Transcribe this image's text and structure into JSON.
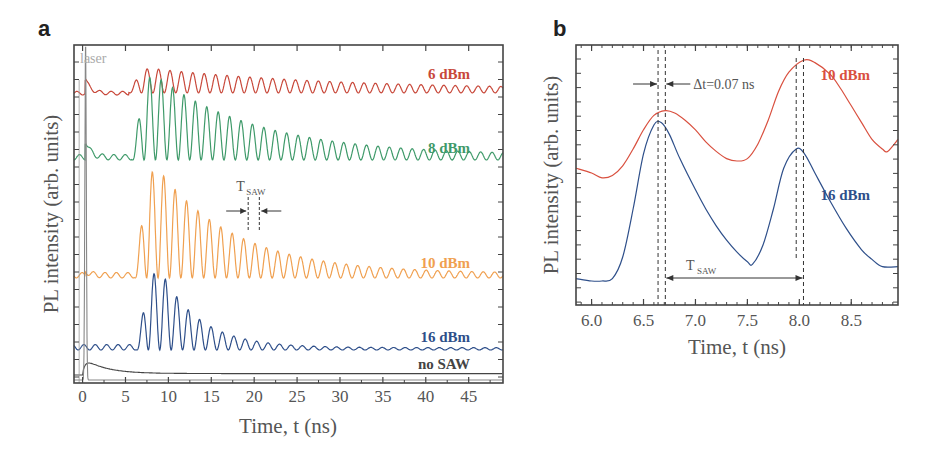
{
  "chart_data": [
    {
      "panel": "a",
      "type": "line",
      "title": "",
      "xlabel": "Time, t (ns)",
      "ylabel": "PL intensity (arb. units)",
      "xlim": [
        -1,
        49
      ],
      "xticks": [
        0,
        5,
        10,
        15,
        20,
        25,
        30,
        35,
        40,
        45
      ],
      "grid": false,
      "annotations": {
        "laser": "laser",
        "tsaw_main": "T",
        "tsaw_sub": "SAW",
        "tsaw_markers_ns": [
          19.3,
          20.6
        ]
      },
      "series": [
        {
          "name": "6 dBm",
          "color": "#c8483a",
          "label": "6 dBm",
          "onset_ns": 6.0,
          "period_ns": 1.33,
          "peak_amplitude": 0.4,
          "decay_ns": 22,
          "baseline_level": 0.85,
          "laser_spike": 0.25
        },
        {
          "name": "8 dBm",
          "color": "#3f9a6a",
          "label": "8 dBm",
          "onset_ns": 6.3,
          "period_ns": 1.33,
          "peak_amplitude": 1.0,
          "decay_ns": 12,
          "baseline_level": 0.67,
          "laser_spike": 0.2
        },
        {
          "name": "10 dBm",
          "color": "#f0a050",
          "label": "10 dBm",
          "onset_ns": 6.6,
          "period_ns": 1.33,
          "peak_amplitude": 1.3,
          "decay_ns": 9,
          "baseline_level": 0.31,
          "laser_spike": 0.05
        },
        {
          "name": "16 dBm",
          "color": "#2e4f8a",
          "label": "16 dBm",
          "onset_ns": 6.8,
          "period_ns": 1.33,
          "peak_amplitude": 0.95,
          "decay_ns": 4.5,
          "baseline_level": 0.1,
          "laser_spike": 0.0
        },
        {
          "name": "no SAW",
          "color": "#444444",
          "label": "no SAW",
          "onset_ns": 0,
          "period_ns": 0,
          "peak_amplitude": 0.1,
          "decay_ns": 3,
          "baseline_level": 0.02,
          "laser_spike": 0.0
        },
        {
          "name": "laser",
          "color": "#888888",
          "label": "laser",
          "onset_ns": 0,
          "period_ns": 0,
          "peak_amplitude": 0.95,
          "decay_ns": 0.2,
          "baseline_level": 0.0,
          "laser_spike": 0.0
        }
      ]
    },
    {
      "panel": "b",
      "type": "line",
      "title": "",
      "xlabel": "Time, t (ns)",
      "ylabel": "PL intensity (arb. units)",
      "xlim": [
        5.85,
        8.95
      ],
      "xticks": [
        "6.0",
        "6.5",
        "7.0",
        "7.5",
        "8.0",
        "8.5"
      ],
      "grid": false,
      "annotations": {
        "delta_t": "Δt=0.07 ns",
        "tsaw_main": "T",
        "tsaw_sub": "SAW",
        "dashed_lines_ns": [
          6.64,
          6.71,
          7.97,
          8.04
        ]
      },
      "series": [
        {
          "name": "10 dBm",
          "color": "#d9503f",
          "label": "10 dBm",
          "x": [
            5.85,
            6.0,
            6.1,
            6.2,
            6.3,
            6.4,
            6.5,
            6.6,
            6.71,
            6.8,
            6.9,
            7.0,
            7.1,
            7.2,
            7.3,
            7.4,
            7.5,
            7.6,
            7.7,
            7.8,
            7.9,
            8.04,
            8.15,
            8.3,
            8.4,
            8.5,
            8.6,
            8.7,
            8.8,
            8.85,
            8.95
          ],
          "y": [
            0.52,
            0.5,
            0.48,
            0.49,
            0.53,
            0.6,
            0.68,
            0.74,
            0.76,
            0.75,
            0.72,
            0.68,
            0.63,
            0.59,
            0.56,
            0.55,
            0.56,
            0.62,
            0.72,
            0.84,
            0.92,
            0.97,
            0.96,
            0.91,
            0.85,
            0.78,
            0.71,
            0.64,
            0.6,
            0.59,
            0.64
          ]
        },
        {
          "name": "16 dBm",
          "color": "#2e4f8a",
          "label": "16 dBm",
          "x": [
            5.85,
            6.0,
            6.1,
            6.2,
            6.3,
            6.4,
            6.5,
            6.6,
            6.67,
            6.75,
            6.85,
            7.0,
            7.1,
            7.2,
            7.3,
            7.4,
            7.5,
            7.55,
            7.65,
            7.75,
            7.85,
            7.97,
            8.05,
            8.15,
            8.3,
            8.45,
            8.6,
            8.7,
            8.8,
            8.95
          ],
          "y": [
            0.06,
            0.05,
            0.05,
            0.06,
            0.15,
            0.35,
            0.58,
            0.7,
            0.71,
            0.66,
            0.56,
            0.43,
            0.35,
            0.28,
            0.22,
            0.17,
            0.13,
            0.12,
            0.2,
            0.35,
            0.52,
            0.6,
            0.58,
            0.5,
            0.38,
            0.27,
            0.18,
            0.14,
            0.11,
            0.11
          ]
        }
      ]
    }
  ],
  "panels": {
    "a_letter": "a",
    "b_letter": "b"
  }
}
